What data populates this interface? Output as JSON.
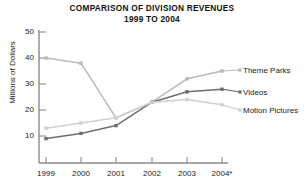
{
  "chart_data": {
    "type": "line",
    "title": "COMPARISON OF DIVISION REVENUES",
    "subtitle": "1999 TO 2004",
    "xlabel": "",
    "ylabel": "Millions of Dollars",
    "categories": [
      "1999",
      "2000",
      "2001",
      "2002",
      "2003",
      "2004*"
    ],
    "x_tick_labels": [
      "1999",
      "2000",
      "2001",
      "2002",
      "2003",
      "2004*"
    ],
    "y_tick_labels": [
      "10",
      "20",
      "30",
      "40",
      "50"
    ],
    "y_ticks": [
      10,
      20,
      30,
      40,
      50
    ],
    "ylim": [
      0,
      50
    ],
    "grid": false,
    "legend_position": "right-inline",
    "series": [
      {
        "name": "Theme Parks",
        "values": [
          40,
          38,
          17,
          23,
          32,
          35
        ],
        "color": "#b9b9b9"
      },
      {
        "name": "Videos",
        "values": [
          9,
          11,
          14,
          23,
          27,
          28
        ],
        "color": "#6e6e6e"
      },
      {
        "name": "Motion Pictures",
        "values": [
          13,
          15,
          17,
          23,
          24,
          22
        ],
        "color": "#cfcfcf"
      }
    ],
    "footnote_marker": "*"
  },
  "axis": {
    "y_ticks": [
      {
        "label": "50"
      },
      {
        "label": "40"
      },
      {
        "label": "30"
      },
      {
        "label": "20"
      },
      {
        "label": "10"
      }
    ],
    "x_ticks": [
      {
        "label": "1999"
      },
      {
        "label": "2000"
      },
      {
        "label": "2001"
      },
      {
        "label": "2002"
      },
      {
        "label": "2003"
      },
      {
        "label": "2004*"
      }
    ],
    "ylabel": "Millions of Dollars"
  },
  "legend": {
    "items": [
      {
        "label": "Theme Parks"
      },
      {
        "label": "Videos"
      },
      {
        "label": "Motion Pictures"
      }
    ]
  },
  "title": {
    "line1": "COMPARISON OF DIVISION REVENUES",
    "line2": "1999 TO 2004"
  },
  "colors": {
    "theme_parks": "#b9b9b9",
    "videos": "#6e6e6e",
    "motion_pictures": "#cfcfcf",
    "axis": "#8a8a8a",
    "text": "#1a1a1a"
  }
}
